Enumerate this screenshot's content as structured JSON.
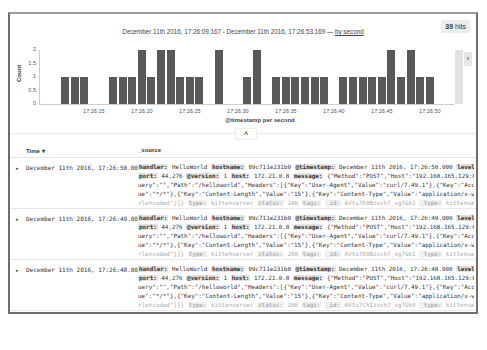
{
  "header": {
    "hits_count": "39",
    "hits_label": "hits",
    "range_text": "December 11th 2016, 17:26:09.167 - December 11th 2016, 17:26:53.169 —",
    "interval_link": "by second",
    "side_toggle_icon": "‹"
  },
  "chart_data": {
    "type": "bar",
    "title": "December 11th 2016, 17:26:09.167 - December 11th 2016, 17:26:53.169",
    "xlabel": "@timestamp per second",
    "ylabel": "Count",
    "ylim": [
      0,
      2
    ],
    "yticks": [
      "2",
      "1.5",
      "1",
      "0.5",
      "0"
    ],
    "xticks": [
      "17:26:15",
      "17:26:20",
      "17:26:25",
      "17:26:30",
      "17:26:35",
      "17:26:40",
      "17:26:45",
      "17:26:50"
    ],
    "categories": [
      "17:26:12",
      "17:26:13",
      "17:26:14",
      "17:26:15",
      "17:26:16",
      "17:26:17",
      "17:26:18",
      "17:26:19",
      "17:26:20",
      "17:26:21",
      "17:26:22",
      "17:26:23",
      "17:26:24",
      "17:26:25",
      "17:26:26",
      "17:26:27",
      "17:26:28",
      "17:26:29",
      "17:26:30",
      "17:26:31",
      "17:26:32",
      "17:26:33",
      "17:26:34",
      "17:26:35",
      "17:26:36",
      "17:26:37",
      "17:26:38",
      "17:26:39",
      "17:26:40",
      "17:26:41",
      "17:26:42",
      "17:26:43",
      "17:26:44",
      "17:26:45",
      "17:26:46",
      "17:26:47",
      "17:26:48",
      "17:26:49",
      "17:26:50",
      "17:26:51",
      "17:26:52",
      "17:26:53"
    ],
    "values": [
      1,
      1,
      1,
      0,
      0,
      1,
      1,
      1,
      2,
      1,
      2,
      2,
      1,
      1,
      1,
      0,
      2,
      0,
      0,
      1,
      2,
      0,
      1,
      1,
      1,
      1,
      1,
      1,
      0,
      1,
      1,
      1,
      1,
      1,
      2,
      1,
      2,
      1,
      1,
      0,
      0,
      2
    ],
    "partial_bucket": "17:26:53",
    "grid": false,
    "legend": "none"
  },
  "chart_toggle_icon": "˄",
  "table": {
    "columns": [
      "Time ▾",
      "_source"
    ],
    "rows": [
      {
        "time": "December 11th 2016, 17:26:50.000",
        "lines": [
          [
            [
              "k",
              "handler:"
            ],
            [
              "v",
              " HelloWorld "
            ],
            [
              "k",
              "hostname:"
            ],
            [
              "v",
              " 09c711e231b0 "
            ],
            [
              "k",
              "@timestamp:"
            ],
            [
              "v",
              " December 11th 2016, 17:26:50.000 "
            ],
            [
              "k",
              "level:"
            ],
            [
              "v",
              " info"
            ]
          ],
          [
            [
              "k",
              "port:"
            ],
            [
              "v",
              " 44,276 "
            ],
            [
              "k",
              "@version:"
            ],
            [
              "v",
              " 1 "
            ],
            [
              "k",
              "host:"
            ],
            [
              "v",
              " 172.21.0.8 "
            ],
            [
              "k",
              "message:"
            ],
            [
              "v",
              " {\"Method\":\"POST\",\"Host\":\"192.168.165.129:8091\",\"Q"
            ]
          ],
          [
            [
              "v",
              "uery\":\"\",\"Path\":\"/helloworld\",\"Headers\":[{\"Key\":\"User-Agent\",\"Value\":\"curl/7.49.1\"},{\"Key\":\"Accept\",\"Val"
            ]
          ],
          [
            [
              "v",
              "ue\":\"*/*\"},{\"Key\":\"Content-Length\",\"Value\":\"15\"},{\"Key\":\"Content-Type\",\"Value\":\"application/x-www-form-u"
            ]
          ],
          [
            [
              "f",
              "rlencoded\"}]} "
            ],
            [
              "fk",
              "type:"
            ],
            [
              "f",
              " kittenserver "
            ],
            [
              "fk",
              "status:"
            ],
            [
              "f",
              " 200 "
            ],
            [
              "fk",
              "tags:"
            ],
            [
              "f",
              "  "
            ],
            [
              "fk",
              "_id:"
            ],
            [
              "f",
              " AVtu7E8Bzxch7_vg7Gk2 "
            ],
            [
              "fk",
              "_type:"
            ],
            [
              "f",
              " kittenserver"
            ]
          ]
        ]
      },
      {
        "time": "December 11th 2016, 17:26:49.000",
        "lines": [
          [
            [
              "k",
              "handler:"
            ],
            [
              "v",
              " HelloWorld "
            ],
            [
              "k",
              "hostname:"
            ],
            [
              "v",
              " 09c711e231b0 "
            ],
            [
              "k",
              "@timestamp:"
            ],
            [
              "v",
              " December 11th 2016, 17:26:49.000 "
            ],
            [
              "k",
              "level:"
            ],
            [
              "v",
              " info"
            ]
          ],
          [
            [
              "k",
              "port:"
            ],
            [
              "v",
              " 44,276 "
            ],
            [
              "k",
              "@version:"
            ],
            [
              "v",
              " 1 "
            ],
            [
              "k",
              "host:"
            ],
            [
              "v",
              " 172.21.0.8 "
            ],
            [
              "k",
              "message:"
            ],
            [
              "v",
              " {\"Method\":\"POST\",\"Host\":\"192.168.165.129:8091\",\"Q"
            ]
          ],
          [
            [
              "v",
              "uery\":\"\",\"Path\":\"/helloworld\",\"Headers\":[{\"Key\":\"User-Agent\",\"Value\":\"curl/7.49.1\"},{\"Key\":\"Accept\",\"Val"
            ]
          ],
          [
            [
              "v",
              "ue\":\"*/*\"},{\"Key\":\"Content-Length\",\"Value\":\"15\"},{\"Key\":\"Content-Type\",\"Value\":\"application/x-www-form-u"
            ]
          ],
          [
            [
              "f",
              "rlencoded\"}]} "
            ],
            [
              "fk",
              "type:"
            ],
            [
              "f",
              " kittenserver "
            ],
            [
              "fk",
              "status:"
            ],
            [
              "f",
              " 200 "
            ],
            [
              "fk",
              "tags:"
            ],
            [
              "f",
              "  "
            ],
            [
              "fk",
              "_id:"
            ],
            [
              "f",
              " AVtu7D9Bzxch7_vg7Gk1 "
            ],
            [
              "fk",
              "_type:"
            ],
            [
              "f",
              " kittenserver"
            ]
          ]
        ]
      },
      {
        "time": "December 11th 2016, 17:26:48.000",
        "lines": [
          [
            [
              "k",
              "handler:"
            ],
            [
              "v",
              " HelloWorld "
            ],
            [
              "k",
              "hostname:"
            ],
            [
              "v",
              " 09c711e231b0 "
            ],
            [
              "k",
              "@timestamp:"
            ],
            [
              "v",
              " December 11th 2016, 17:26:48.000 "
            ],
            [
              "k",
              "level:"
            ],
            [
              "v",
              " info"
            ]
          ],
          [
            [
              "k",
              "port:"
            ],
            [
              "v",
              " 44,276 "
            ],
            [
              "k",
              "@version:"
            ],
            [
              "v",
              " 1 "
            ],
            [
              "k",
              "host:"
            ],
            [
              "v",
              " 172.21.0.8 "
            ],
            [
              "k",
              "message:"
            ],
            [
              "v",
              " {\"Method\":\"POST\",\"Host\":\"192.168.165.129:8091\",\"Q"
            ]
          ],
          [
            [
              "v",
              "uery\":\"\",\"Path\":\"/helloworld\",\"Headers\":[{\"Key\":\"User-Agent\",\"Value\":\"curl/7.49.1\"},{\"Key\":\"Accept\",\"Val"
            ]
          ],
          [
            [
              "v",
              "ue\":\"*/*\"},{\"Key\":\"Content-Length\",\"Value\":\"15\"},{\"Key\":\"Content-Type\",\"Value\":\"application/x-www-form-u"
            ]
          ],
          [
            [
              "f",
              "rlencoded\"}]} "
            ],
            [
              "fk",
              "type:"
            ],
            [
              "f",
              " kittenserver "
            ],
            [
              "fk",
              "status:"
            ],
            [
              "f",
              " 200 "
            ],
            [
              "fk",
              "tags:"
            ],
            [
              "f",
              "  "
            ],
            [
              "fk",
              "_id:"
            ],
            [
              "f",
              " AVtu7ChIzvch7_vg7Gk0 "
            ],
            [
              "fk",
              "_type:"
            ],
            [
              "f",
              " kittenserver"
            ]
          ]
        ]
      }
    ],
    "expand_icon": "▸"
  }
}
